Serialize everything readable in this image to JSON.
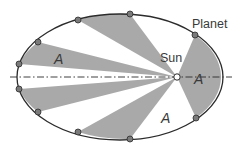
{
  "diagram": {
    "labels": {
      "planet": "Planet",
      "sun": "Sun",
      "area_left": "A",
      "area_right": "A",
      "area_bottom": "A"
    },
    "colors": {
      "sector_fill": "#a9a9a9",
      "orbit_stroke": "#2b2b2b",
      "point_fill": "#7a7a7a",
      "sun_fill": "#ffffff",
      "background": "#ffffff"
    },
    "orbit": {
      "cx": 120,
      "cy": 77,
      "rx": 103,
      "ry": 63
    },
    "sun": {
      "x": 177,
      "y": 77
    },
    "planet_positions": [
      [
        130,
        14
      ],
      [
        66,
        31
      ],
      [
        38,
        49
      ],
      [
        19,
        64
      ],
      [
        19,
        89
      ],
      [
        38,
        105
      ],
      [
        66,
        123
      ],
      [
        130,
        139
      ],
      [
        196,
        118
      ],
      [
        195,
        35
      ]
    ]
  }
}
